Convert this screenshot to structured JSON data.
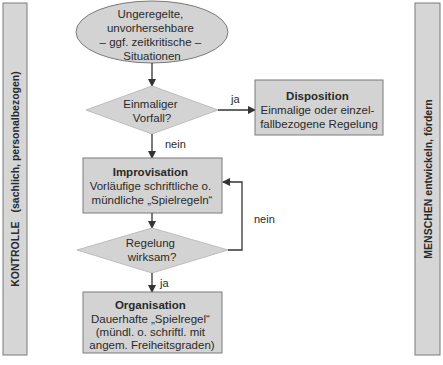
{
  "colors": {
    "shape_fill": "#d3d3d3",
    "shape_stroke": "#7a7a7a",
    "side_bar_fill": "#d6d6d6",
    "line": "#333333",
    "text": "#2a2a2a"
  },
  "side_bars": {
    "left": {
      "text_main": "KONTROLLE",
      "text_sub": "(sachlich, personalbezogen)"
    },
    "right": {
      "text": "MENSCHEN entwickeln, fördern"
    }
  },
  "nodes": {
    "start": {
      "lines": [
        "Ungeregelte,",
        "unvorhersehbare",
        "– ggf. zeitkritische –",
        "Situationen"
      ]
    },
    "decision1": {
      "lines": [
        "Einmaliger",
        "Vorfall?"
      ]
    },
    "disposition": {
      "title": "Disposition",
      "lines": [
        "Einmalige oder einzel-",
        "fallbezogene Regelung"
      ]
    },
    "improvisation": {
      "title": "Improvisation",
      "lines": [
        "Vorläufige schriftliche o.",
        "mündliche „Spielregeln“"
      ]
    },
    "decision2": {
      "lines": [
        "Regelung",
        "wirksam?"
      ]
    },
    "organisation": {
      "title": "Organisation",
      "lines": [
        "Dauerhafte „Spielregel“",
        "(mündl. o. schriftl. mit",
        "angem. Freiheitsgraden)"
      ]
    }
  },
  "edges": {
    "d1_yes": "ja",
    "d1_no": "nein",
    "d2_no": "nein",
    "d2_yes": "ja"
  }
}
